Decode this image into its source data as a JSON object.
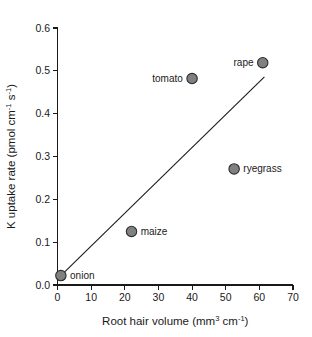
{
  "chart_data": {
    "type": "scatter",
    "title": "",
    "xlabel": "Root hair volume (mm3 cm-1)",
    "ylabel": "K uptake rate (pmol cm-1 s-1)",
    "xlabel_parts": {
      "pre": "Root hair volume (mm",
      "sup1": "3",
      "mid": " cm",
      "sup2": "-1",
      "post": ")"
    },
    "ylabel_parts": {
      "pre": "K uptake rate (pmol cm",
      "sup1": "-1",
      "mid": " s",
      "sup2": "-1",
      "post": ")"
    },
    "xlim": [
      0,
      70
    ],
    "ylim": [
      0.0,
      0.6
    ],
    "xticks": [
      0,
      10,
      20,
      30,
      40,
      50,
      60,
      70
    ],
    "xtick_labels": [
      "0",
      "10",
      "20",
      "30",
      "40",
      "50",
      "60",
      "70"
    ],
    "yticks": [
      0.0,
      0.1,
      0.2,
      0.3,
      0.4,
      0.5,
      0.6
    ],
    "ytick_labels": [
      "0.0",
      "0.1",
      "0.2",
      "0.3",
      "0.4",
      "0.5",
      "0.6"
    ],
    "grid": false,
    "legend": "none",
    "marker_fill": "#808080",
    "marker_stroke": "#2b2b2b",
    "marker_radius": 5.2,
    "points": [
      {
        "label": "onion",
        "x": 1.0,
        "y": 0.022,
        "label_side": "right"
      },
      {
        "label": "maize",
        "x": 22.0,
        "y": 0.125,
        "label_side": "right"
      },
      {
        "label": "ryegrass",
        "x": 52.5,
        "y": 0.271,
        "label_side": "right"
      },
      {
        "label": "tomato",
        "x": 40.0,
        "y": 0.482,
        "label_side": "left"
      },
      {
        "label": "rape",
        "x": 61.0,
        "y": 0.519,
        "label_side": "left"
      }
    ],
    "fit_line": {
      "x0": 1.0,
      "y0": 0.022,
      "x1": 61.5,
      "y1": 0.486
    }
  }
}
